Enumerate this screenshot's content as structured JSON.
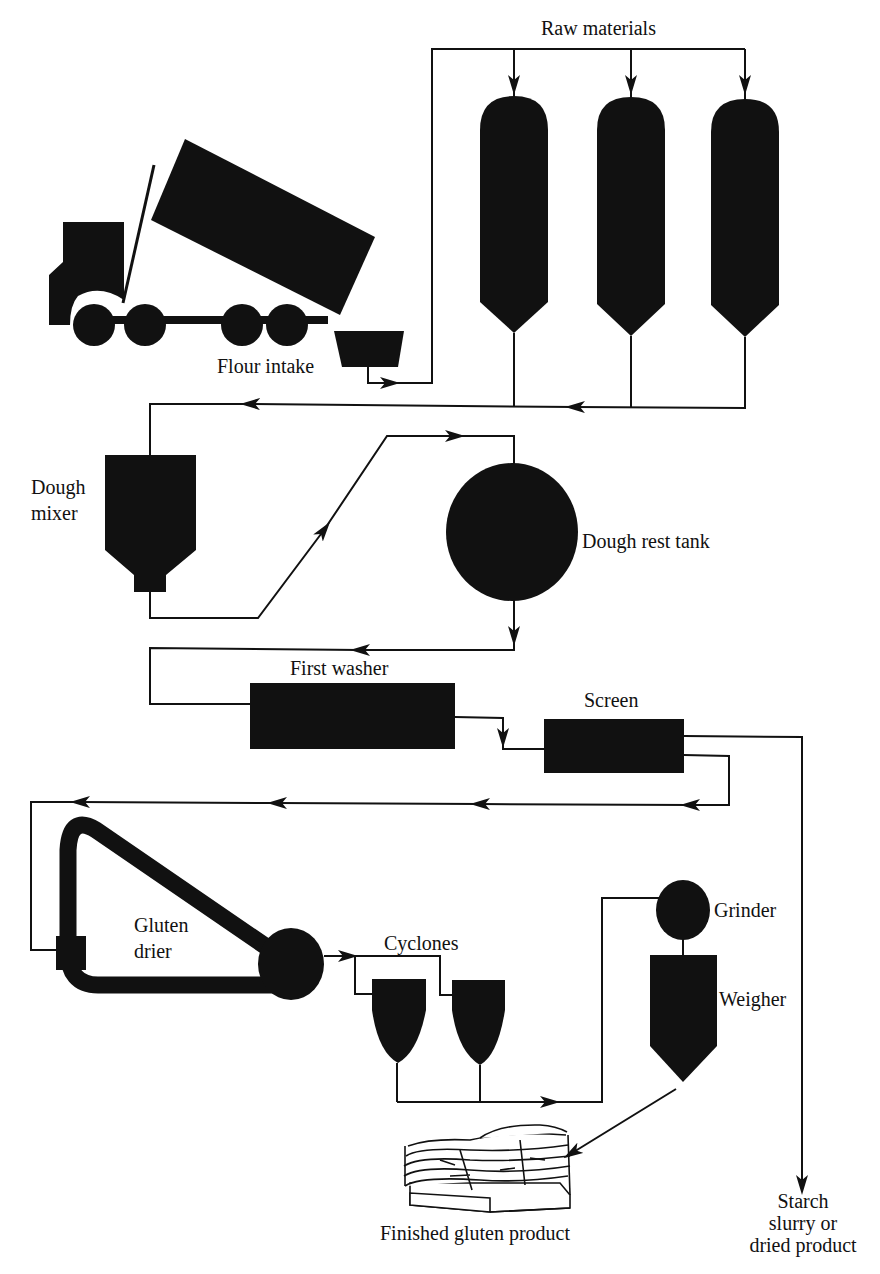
{
  "colors": {
    "equipment": "#111111",
    "line": "#111111",
    "background": "#ffffff"
  },
  "labels": {
    "raw_materials": "Raw materials",
    "flour_intake": "Flour intake",
    "dough_mixer_line1": "Dough",
    "dough_mixer_line2": "mixer",
    "dough_rest_tank": "Dough rest tank",
    "first_washer": "First washer",
    "screen": "Screen",
    "gluten_drier_line1": "Gluten",
    "gluten_drier_line2": "drier",
    "cyclones": "Cyclones",
    "grinder": "Grinder",
    "weigher": "Weigher",
    "finished_product": "Finished gluten product",
    "starch_line1": "Starch",
    "starch_line2": "slurry or",
    "starch_line3": "dried product"
  },
  "equipment": [
    "Delivery truck",
    "Flour intake hopper",
    "Raw material silo 1",
    "Raw material silo 2",
    "Raw material silo 3",
    "Dough mixer",
    "Dough rest tank",
    "First washer",
    "Screen",
    "Gluten drier",
    "Cyclone 1",
    "Cyclone 2",
    "Grinder",
    "Weigher",
    "Pallet of bags"
  ]
}
